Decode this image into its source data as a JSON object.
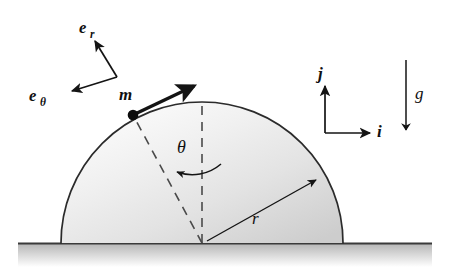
{
  "figure": {
    "name": "mass-sliding-on-hemispherical-dome",
    "background_color": "#ffffff",
    "width": 450,
    "height": 267
  },
  "labels": {
    "e_r_base": "e",
    "e_r_sub": "r",
    "e_theta_base": "e",
    "e_theta_sub": "θ",
    "mass": "m",
    "theta": "θ",
    "radius": "r",
    "i_hat": "i",
    "j_hat": "j",
    "gravity": "g"
  },
  "colors": {
    "ink": "#101010",
    "outline": "#2b2b2b",
    "dome_light": "#fbfbfb",
    "dome_mid": "#ececec",
    "dome_dark": "#cfcfcf",
    "ground_line": "#3a3a3a",
    "ground_fill_top": "#b9b9b9",
    "ground_fill_bottom": "#ffffff",
    "dash": "#4a4a4a"
  },
  "geometry": {
    "dome": {
      "center_x": 202,
      "center_y": 243,
      "radius": 141,
      "apex_x": 202,
      "apex_y": 102,
      "left_foot_x": 61,
      "right_foot_x": 343
    },
    "ground": {
      "line_y": 243,
      "x_start": 18,
      "x_end": 432,
      "band_height": 24
    },
    "mass_point": {
      "x": 133,
      "y": 115
    },
    "velocity_arrow": {
      "x1": 134,
      "y1": 114,
      "x2": 196,
      "y2": 85
    },
    "radial_dash": {
      "x1": 202,
      "y1": 243,
      "x2": 133,
      "y2": 115
    },
    "vertical_dash": {
      "x1": 202,
      "y1": 243,
      "x2": 202,
      "y2": 102
    },
    "theta_arc": {
      "from_x": 220,
      "from_y": 163,
      "to_x": 176,
      "to_y": 171
    },
    "radius_arrow": {
      "x1": 206,
      "y1": 241,
      "x2": 316,
      "y2": 180
    },
    "e_vectors": {
      "corner_x": 117,
      "corner_y": 77,
      "er_tip_x": 94,
      "er_tip_y": 38,
      "et_tip_x": 69,
      "et_tip_y": 92
    },
    "ij_axes": {
      "corner_x": 325,
      "corner_y": 133,
      "j_tip_x": 325,
      "j_tip_y": 84,
      "i_tip_x": 372,
      "i_tip_y": 133
    },
    "gravity_arrow": {
      "x": 406,
      "y1": 60,
      "y2": 134
    }
  },
  "label_positions": {
    "e_r": {
      "x": 79,
      "y": 33
    },
    "e_theta": {
      "x": 29,
      "y": 101
    },
    "mass": {
      "x": 120,
      "y": 99
    },
    "theta": {
      "x": 179,
      "y": 152
    },
    "radius": {
      "x": 253,
      "y": 222
    },
    "i_hat": {
      "x": 379,
      "y": 135
    },
    "j_hat": {
      "x": 320,
      "y": 78
    },
    "gravity": {
      "x": 417,
      "y": 97
    }
  }
}
